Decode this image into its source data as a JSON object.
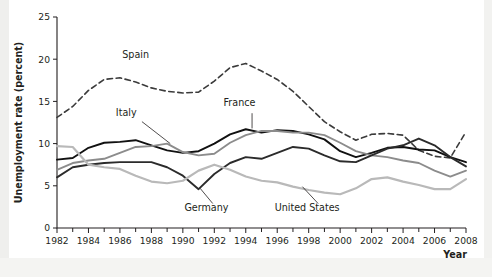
{
  "figure": {
    "background_color": "#ffffff",
    "axis_color": "#231f20"
  },
  "chart_data": {
    "type": "line",
    "title": "",
    "subtitle": "",
    "xlabel": "Year",
    "ylabel": "Unemployment rate (percent)",
    "xlim": [
      1982,
      2008
    ],
    "ylim": [
      0,
      25
    ],
    "yticks": [
      0,
      5,
      10,
      15,
      20,
      25
    ],
    "ytick_labels": [
      "0",
      "5",
      "10",
      "15",
      "20",
      "25"
    ],
    "xticks": [
      1982,
      1983,
      1984,
      1985,
      1986,
      1987,
      1988,
      1989,
      1990,
      1991,
      1992,
      1993,
      1994,
      1995,
      1996,
      1997,
      1998,
      1999,
      2000,
      2001,
      2002,
      2003,
      2004,
      2005,
      2006,
      2007,
      2008
    ],
    "xtick_labels_major": [
      "1982",
      "1984",
      "1986",
      "1988",
      "1990",
      "1992",
      "1994",
      "1996",
      "1998",
      "2000",
      "2002",
      "2004",
      "2006",
      "2008"
    ],
    "xticks_major": [
      1982,
      1984,
      1986,
      1988,
      1990,
      1992,
      1994,
      1996,
      1998,
      2000,
      2002,
      2004,
      2006,
      2008
    ],
    "grid": false,
    "legend_position": "inline-annotations",
    "x": [
      1982,
      1983,
      1984,
      1985,
      1986,
      1987,
      1988,
      1989,
      1990,
      1991,
      1992,
      1993,
      1994,
      1995,
      1996,
      1997,
      1998,
      1999,
      2000,
      2001,
      2002,
      2003,
      2004,
      2005,
      2006,
      2007,
      2008
    ],
    "series": [
      {
        "name": "Spain",
        "color": "#3b3b3b",
        "style": "dashed",
        "width": 1.6,
        "values": [
          13.1,
          14.4,
          16.3,
          17.6,
          17.8,
          17.3,
          16.6,
          16.2,
          16.0,
          16.1,
          17.4,
          19.0,
          19.5,
          18.6,
          17.6,
          16.2,
          14.4,
          12.6,
          11.4,
          10.4,
          11.1,
          11.2,
          11.0,
          9.2,
          8.5,
          8.3,
          11.4
        ]
      },
      {
        "name": "France",
        "color": "#111111",
        "style": "solid",
        "width": 1.9,
        "values": [
          8.1,
          8.3,
          9.5,
          10.1,
          10.2,
          10.4,
          9.8,
          9.2,
          8.9,
          9.1,
          10.0,
          11.1,
          11.7,
          11.3,
          11.6,
          11.5,
          11.1,
          10.5,
          9.1,
          8.4,
          8.9,
          9.5,
          9.6,
          9.3,
          9.2,
          8.4,
          7.8
        ]
      },
      {
        "name": "Italy",
        "color": "#8c8c8c",
        "style": "solid",
        "width": 1.9,
        "values": [
          6.9,
          7.7,
          8.0,
          8.2,
          8.9,
          9.6,
          9.7,
          10.0,
          9.0,
          8.6,
          8.8,
          10.1,
          11.0,
          11.5,
          11.5,
          11.3,
          11.3,
          11.0,
          10.1,
          9.1,
          8.6,
          8.4,
          8.0,
          7.7,
          6.8,
          6.1,
          6.8
        ]
      },
      {
        "name": "Germany",
        "color": "#2b2b2b",
        "style": "solid",
        "width": 1.9,
        "values": [
          6.0,
          7.2,
          7.5,
          7.7,
          7.8,
          7.8,
          7.8,
          7.2,
          6.2,
          4.6,
          6.4,
          7.7,
          8.4,
          8.2,
          8.9,
          9.6,
          9.4,
          8.6,
          7.9,
          7.8,
          8.6,
          9.4,
          9.8,
          10.6,
          9.8,
          8.4,
          7.3
        ]
      },
      {
        "name": "United States",
        "color": "#b9b9b9",
        "style": "solid",
        "width": 2.2,
        "values": [
          9.7,
          9.6,
          7.5,
          7.2,
          7.0,
          6.2,
          5.5,
          5.3,
          5.6,
          6.8,
          7.5,
          6.9,
          6.1,
          5.6,
          5.4,
          4.9,
          4.5,
          4.2,
          4.0,
          4.7,
          5.8,
          6.0,
          5.5,
          5.1,
          4.6,
          4.6,
          5.8
        ]
      }
    ],
    "annotations": [
      {
        "label": "Spain",
        "x": 1987.0,
        "y": 20.1
      },
      {
        "label": "Italy",
        "x": 1986.4,
        "y": 13.3
      },
      {
        "label": "France",
        "x": 1993.6,
        "y": 14.4
      },
      {
        "label": "Germany",
        "x": 1991.5,
        "y": 2.0
      },
      {
        "label": "United States",
        "x": 1997.9,
        "y": 2.0
      }
    ]
  }
}
